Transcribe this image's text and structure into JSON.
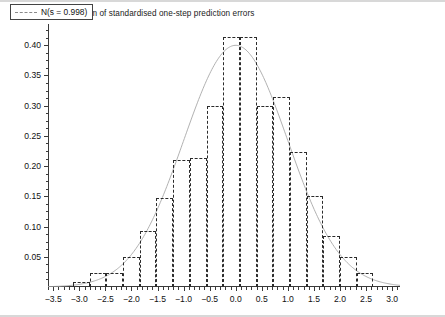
{
  "figure": {
    "title": "Histogram of standardised one-step prediction errors",
    "background": "#ffffff",
    "frame_color": "#3a3a3a"
  },
  "legend": {
    "position": "top-left",
    "entries": [
      {
        "label": "N(s = 0.998)",
        "style": "dashed",
        "color": "#8a8a8a"
      }
    ]
  },
  "chart_data": {
    "type": "bar",
    "title": "Histogram of standardised one-step prediction errors",
    "subtitle": "",
    "xlabel": "",
    "ylabel": "",
    "xlim": [
      -3.6,
      3.15
    ],
    "ylim": [
      0.0,
      0.435
    ],
    "grid": false,
    "legend_position": "top-left",
    "bar_style": {
      "fill": "none",
      "edge_color": "#2b2b2b",
      "edge_style": "dashed"
    },
    "xticks": [
      -3.5,
      -3.0,
      -2.5,
      -2.0,
      -1.5,
      -1.0,
      -0.5,
      0.0,
      0.5,
      1.0,
      1.5,
      2.0,
      2.5,
      3.0
    ],
    "xticklabels": [
      "−3.5",
      "−3.0",
      "−2.5",
      "−2.0",
      "−1.5",
      "−1.0",
      "−0.5",
      "0.0",
      "0.5",
      "1.0",
      "1.5",
      "2.0",
      "2.5",
      "3.0"
    ],
    "xtick_minor_step": 0.1,
    "yticks": [
      0.05,
      0.1,
      0.15,
      0.2,
      0.25,
      0.3,
      0.35,
      0.4
    ],
    "yticklabels": [
      "0.05",
      "0.10",
      "0.15",
      "0.20",
      "0.25",
      "0.30",
      "0.35",
      "0.40"
    ],
    "ytick_minor_step": 0.0125,
    "bin_width": 0.32,
    "bins": [
      {
        "left": -3.12,
        "right": -2.8,
        "center": -2.96,
        "density": 0.008
      },
      {
        "left": -2.8,
        "right": -2.48,
        "center": -2.64,
        "density": 0.023
      },
      {
        "left": -2.48,
        "right": -2.16,
        "center": -2.32,
        "density": 0.023
      },
      {
        "left": -2.16,
        "right": -1.84,
        "center": -2.0,
        "density": 0.05
      },
      {
        "left": -1.84,
        "right": -1.52,
        "center": -1.68,
        "density": 0.092
      },
      {
        "left": -1.52,
        "right": -1.2,
        "center": -1.36,
        "density": 0.148
      },
      {
        "left": -1.2,
        "right": -0.88,
        "center": -1.04,
        "density": 0.21
      },
      {
        "left": -0.88,
        "right": -0.56,
        "center": -0.72,
        "density": 0.213
      },
      {
        "left": -0.56,
        "right": -0.24,
        "center": -0.4,
        "density": 0.3
      },
      {
        "left": -0.24,
        "right": 0.08,
        "center": -0.08,
        "density": 0.413
      },
      {
        "left": 0.08,
        "right": 0.4,
        "center": 0.24,
        "density": 0.413
      },
      {
        "left": 0.4,
        "right": 0.72,
        "center": 0.56,
        "density": 0.3
      },
      {
        "left": 0.72,
        "right": 1.04,
        "center": 0.88,
        "density": 0.315
      },
      {
        "left": 1.04,
        "right": 1.36,
        "center": 1.2,
        "density": 0.223
      },
      {
        "left": 1.36,
        "right": 1.68,
        "center": 1.52,
        "density": 0.15
      },
      {
        "left": 1.68,
        "right": 2.0,
        "center": 1.84,
        "density": 0.085
      },
      {
        "left": 2.0,
        "right": 2.32,
        "center": 2.16,
        "density": 0.05
      },
      {
        "left": 2.32,
        "right": 2.64,
        "center": 2.48,
        "density": 0.023
      }
    ],
    "overlay_curve": {
      "name": "N(s = 0.998)",
      "type": "line",
      "style": "solid-thin",
      "color": "#a8a8a8",
      "mean": 0.0,
      "sd": 0.998,
      "peak": 0.3997
    }
  }
}
